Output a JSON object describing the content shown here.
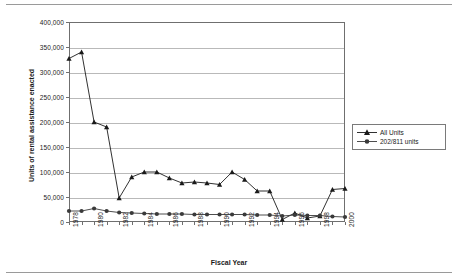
{
  "figure": {
    "xaxis_title": "Fiscal Year",
    "yaxis_title": "Units of rental assistance enacted"
  },
  "legend": {
    "items": [
      {
        "label": "All Units",
        "marker": "triangle-marker",
        "color": "#1a1a1a"
      },
      {
        "label": "202/811 units",
        "marker": "circle-marker",
        "color": "#3a3a3a"
      }
    ]
  },
  "chart_data": {
    "type": "line",
    "title": "",
    "xlabel": "Fiscal Year",
    "ylabel": "Units of rental assistance enacted",
    "x": [
      1978,
      1979,
      1980,
      1981,
      1982,
      1983,
      1984,
      1985,
      1986,
      1987,
      1988,
      1989,
      1990,
      1991,
      1992,
      1993,
      1994,
      1995,
      1996,
      1997,
      1998,
      1999,
      2000
    ],
    "xtick_labels": [
      "1978",
      "1980",
      "1982",
      "1984",
      "1986",
      "1988",
      "1990",
      "1992",
      "1994",
      "1996",
      "1998",
      "2000"
    ],
    "xtick_years": [
      1978,
      1980,
      1982,
      1984,
      1986,
      1988,
      1990,
      1992,
      1994,
      1996,
      1998,
      2000
    ],
    "ylim": [
      0,
      400000
    ],
    "ytick_values": [
      0,
      50000,
      100000,
      150000,
      200000,
      250000,
      300000,
      350000,
      400000
    ],
    "ytick_labels": [
      "0",
      "50,000",
      "100,000",
      "150,000",
      "200,000",
      "250,000",
      "300,000",
      "350,000",
      "400,000"
    ],
    "grid": "horizontal",
    "legend_position": "right-middle",
    "series": [
      {
        "name": "All Units",
        "marker": "triangle",
        "color": "#1a1a1a",
        "values": [
          327000,
          340000,
          200000,
          190000,
          48000,
          90000,
          100000,
          100000,
          88000,
          78000,
          80000,
          78000,
          75000,
          100000,
          85000,
          62000,
          62000,
          5000,
          18000,
          8000,
          12000,
          65000,
          67000
        ]
      },
      {
        "name": "202/811 units",
        "marker": "circle",
        "color": "#3a3a3a",
        "values": [
          22000,
          22000,
          27000,
          22000,
          19000,
          18000,
          17000,
          16000,
          16000,
          16000,
          15000,
          15000,
          15000,
          15000,
          15000,
          14000,
          14000,
          12000,
          14000,
          13000,
          13000,
          11000,
          10000
        ]
      }
    ]
  }
}
